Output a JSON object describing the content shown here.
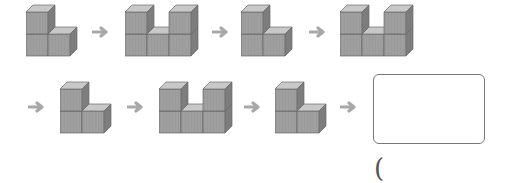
{
  "puzzle": {
    "sequence": [
      {
        "shape": "L",
        "description": "two stacked cubes with one cube to the right"
      },
      {
        "shape": "U",
        "description": "two towers of two cubes with one cube between"
      },
      {
        "shape": "L",
        "description": "two stacked cubes with one cube to the right"
      },
      {
        "shape": "U",
        "description": "two towers of two cubes with one cube between"
      },
      {
        "shape": "L",
        "description": "two stacked cubes with one cube to the right"
      },
      {
        "shape": "U",
        "description": "two towers of two cubes with one cube between"
      },
      {
        "shape": "L",
        "description": "two stacked cubes with one cube to the right"
      }
    ],
    "answer_box": "",
    "answer_paren_open": "("
  },
  "colors": {
    "cube_front": "#9a9a9a",
    "cube_top": "#c8c8c8",
    "cube_side": "#7d7d7d",
    "edge": "#6a6a6a",
    "arrow": "#a8a8a8"
  }
}
